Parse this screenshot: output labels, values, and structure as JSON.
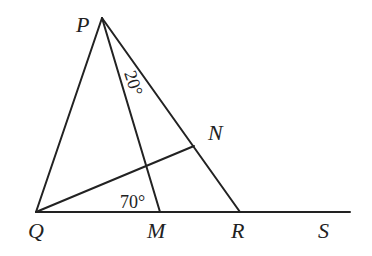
{
  "diagram": {
    "type": "geometry",
    "points": {
      "P": {
        "label": "P",
        "x": 102,
        "y": 18
      },
      "Q": {
        "label": "Q",
        "x": 36,
        "y": 212
      },
      "M": {
        "label": "M",
        "x": 160,
        "y": 212
      },
      "R": {
        "label": "R",
        "x": 240,
        "y": 212
      },
      "S": {
        "label": "S",
        "x": 350,
        "y": 212
      },
      "N": {
        "label": "N",
        "x": 194,
        "y": 146
      }
    },
    "segments": [
      "PQ",
      "PR",
      "PM",
      "QN",
      "QS"
    ],
    "angles": {
      "MPR": "20°",
      "PMQ": "70°"
    }
  }
}
